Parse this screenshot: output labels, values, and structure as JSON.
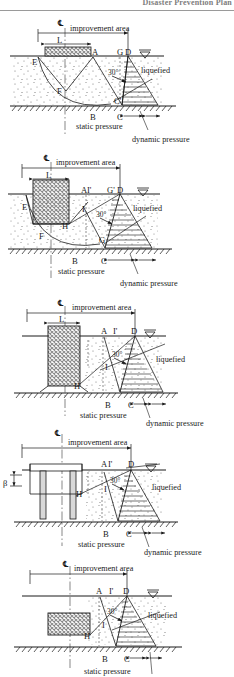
{
  "header": {
    "running_title": "Disaster Prevention Plan"
  },
  "common": {
    "centerline_symbol": "℄",
    "improvement_area_label": "improvement area",
    "liquefied_label": "liquefied",
    "static_pressure_label": "static pressure",
    "dynamic_pressure_label": "dynamic pressure",
    "length_label": "L",
    "angle_label": "30°",
    "beta_label": "β",
    "water_table_icon": "water-table-triangle"
  },
  "figures": [
    {
      "id": "figure-1",
      "improvement_type": "shallow-wide-block",
      "points": [
        "E",
        "A",
        "G",
        "D",
        "F",
        "C'",
        "B",
        "C"
      ],
      "labels": {
        "centerline": "℄",
        "improvement_area": "improvement area",
        "width": "L",
        "liquefied": "liquefied",
        "angle": "30°",
        "static_pressure": "static pressure",
        "dynamic_pressure": "dynamic pressure"
      },
      "has_static_pressure": true,
      "has_dynamic_pressure": true,
      "has_arc": true
    },
    {
      "id": "figure-2",
      "improvement_type": "deep-block-floating",
      "points": [
        "A",
        "I'",
        "G'",
        "D",
        "E",
        "H",
        "I",
        "F",
        "G",
        "B",
        "C"
      ],
      "labels": {
        "centerline": "℄",
        "improvement_area": "improvement area",
        "width": "L",
        "liquefied": "liquefied",
        "angle": "30°",
        "static_pressure": "static pressure",
        "dynamic_pressure": "dynamic pressure"
      },
      "has_static_pressure": true,
      "has_dynamic_pressure": true,
      "has_arc": true
    },
    {
      "id": "figure-3",
      "improvement_type": "full-depth-block",
      "points": [
        "A",
        "I'",
        "D",
        "H",
        "I",
        "B",
        "C"
      ],
      "labels": {
        "centerline": "℄",
        "improvement_area": "improvement area",
        "width": "L",
        "liquefied": "liquefied",
        "angle": "30°",
        "static_pressure": "static pressure",
        "dynamic_pressure": "dynamic pressure"
      },
      "has_static_pressure": true,
      "has_dynamic_pressure": true,
      "has_arc": false
    },
    {
      "id": "figure-4",
      "improvement_type": "pile-supported-structure",
      "points": [
        "A",
        "I'",
        "D",
        "H",
        "I",
        "B",
        "C"
      ],
      "labels": {
        "centerline": "℄",
        "improvement_area": "improvement area",
        "beta": "β",
        "liquefied": "liquefied",
        "angle": "30°",
        "static_pressure": "static pressure",
        "dynamic_pressure": "dynamic pressure"
      },
      "has_static_pressure": true,
      "has_dynamic_pressure": true,
      "has_arc": false
    },
    {
      "id": "figure-5",
      "improvement_type": "buried-block",
      "points": [
        "A",
        "I'",
        "D",
        "H",
        "I",
        "B",
        "C"
      ],
      "labels": {
        "centerline": "℄",
        "improvement_area": "improvement area",
        "liquefied": "liquefied",
        "angle": "30°",
        "static_pressure": "static pressure"
      },
      "has_static_pressure": true,
      "has_dynamic_pressure": false,
      "has_arc": false
    }
  ],
  "colors": {
    "line": "#1a1a1a",
    "fill_hatch": "#8c8c8c",
    "header_text": "#7d7d7d"
  }
}
